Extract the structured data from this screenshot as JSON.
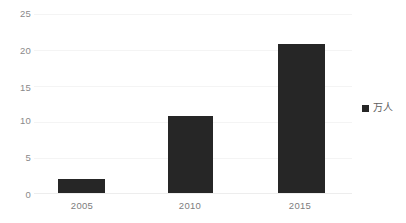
{
  "chart_data": {
    "type": "bar",
    "title": "",
    "subtitle": "",
    "xlabel": "",
    "ylabel": "",
    "categories": [
      "2005",
      "2010",
      "2015"
    ],
    "series": [
      {
        "name": "万人",
        "values": [
          1.9,
          10.7,
          20.8
        ],
        "color": "#262626"
      }
    ],
    "ylim": [
      0,
      25
    ],
    "yticks": [
      0,
      5,
      10,
      15,
      20,
      25
    ],
    "ytick_labels": [
      "0",
      "5",
      "10",
      "15",
      "20",
      "25"
    ],
    "grid": true,
    "grid_axis": "y",
    "legend": {
      "position": "right",
      "entries": [
        {
          "label": "万人",
          "color": "#262626",
          "marker": "square"
        }
      ]
    },
    "colors": {
      "background": "#ffffff",
      "bar": "#262626",
      "gridline": "#f4f4f4",
      "axis_label": "#8a8a8a",
      "category_label": "#7d7d7d",
      "legend_text": "#5e5e5e"
    }
  }
}
